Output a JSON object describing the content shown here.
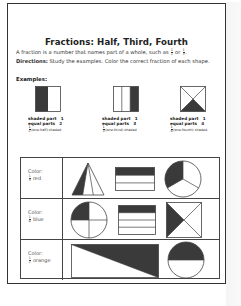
{
  "worksheet": {
    "title": "Fractions: Half, Third, Fourth",
    "intro_text": "A fraction is a number that names part of a whole, such as",
    "intro_frac1": {
      "num": "1",
      "den": "2"
    },
    "intro_or": "or",
    "intro_frac2": {
      "num": "1",
      "den": "3"
    },
    "intro_end": ".",
    "directions_label": "Directions:",
    "directions_text": "Study the examples. Color the correct fraction of each shape.",
    "examples_label": "Examples:",
    "examples": [
      {
        "shape": "square-halves",
        "shaded_label": "shaded part",
        "shaded_value": "1",
        "parts_label": "equal parts",
        "parts_value": "2",
        "frac": {
          "num": "1",
          "den": "2"
        },
        "caption": "(one-half) shaded"
      },
      {
        "shape": "square-thirds",
        "shaded_label": "shaded part",
        "shaded_value": "1",
        "parts_label": "equal parts",
        "parts_value": "3",
        "frac": {
          "num": "1",
          "den": "3"
        },
        "caption": "(one-third) shaded"
      },
      {
        "shape": "square-fourths-diagonal",
        "shaded_label": "shaded part",
        "shaded_value": "1",
        "parts_label": "equal parts",
        "parts_value": "4",
        "frac": {
          "num": "1",
          "den": "4"
        },
        "caption": "(one-fourth) shaded"
      }
    ],
    "rows": [
      {
        "color_label": "Color:",
        "frac": {
          "num": "1",
          "den": "3"
        },
        "color_name": "red",
        "shapes": [
          "triangle-thirds",
          "rectangle-thirds",
          "circle-thirds"
        ]
      },
      {
        "color_label": "Color:",
        "frac": {
          "num": "1",
          "den": "4"
        },
        "color_name": "blue",
        "shapes": [
          "circle-fourths",
          "rectangle-fourths",
          "square-fourths-diagonal"
        ]
      },
      {
        "color_label": "Color:",
        "frac": {
          "num": "1",
          "den": "2"
        },
        "color_name": "orange",
        "shapes": [
          "rectangle-halves-diagonal",
          "circle-halves"
        ]
      }
    ],
    "colors": {
      "shade": "#3a3a3a",
      "line": "#555555",
      "border": "#333333"
    }
  }
}
